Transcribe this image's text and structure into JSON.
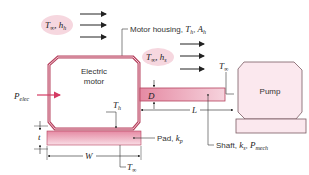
{
  "diagram": {
    "motor_label_line1": "Electric",
    "motor_label_line2": "motor",
    "pump_label": "Pump",
    "air_top": {
      "sym": "T",
      "sub1": "∞",
      "sep": ", ",
      "sym2": "h",
      "sub2": "h"
    },
    "air_shaft": {
      "sym": "T",
      "sub1": "∞",
      "sep": ", ",
      "sym2": "h",
      "sub2": "s"
    },
    "housing_label": {
      "prefix": "Motor housing, ",
      "sym1": "T",
      "sub1": "h",
      "sep": ", ",
      "sym2": "A",
      "sub2": "h"
    },
    "pad_label": {
      "prefix": "Pad, ",
      "sym": "k",
      "sub": "p"
    },
    "shaft_label": {
      "prefix": "Shaft, ",
      "sym1": "k",
      "sub1": "s",
      "sep": ", ",
      "sym2": "P",
      "sub2": "mech"
    },
    "p_elec": {
      "sym": "P",
      "sub": "elec"
    },
    "t_inf_pump": {
      "sym": "T",
      "sub": "∞"
    },
    "t_inf_bottom": {
      "sym": "T",
      "sub": "∞"
    },
    "t_h": {
      "sym": "T",
      "sub": "h"
    },
    "dim_D": "D",
    "dim_L": "L",
    "dim_t": "t",
    "dim_W": "W",
    "colors": {
      "housing_fill": "#f4c9d4",
      "housing_stroke": "#b5425e",
      "pump_fill": "#fbe8ee",
      "pump_stroke": "#7a5a62",
      "bubble_fill": "#f6d7df",
      "accent_arrow": "#d43a62",
      "line": "#333333"
    }
  }
}
